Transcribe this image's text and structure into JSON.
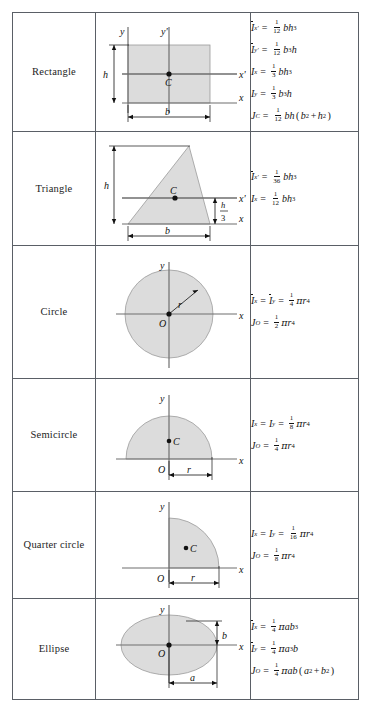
{
  "table": {
    "title": "Properties of Plane Areas",
    "columns": [
      "Shape",
      "Figure",
      "Moments of inertia"
    ],
    "rows": [
      {
        "name": "Rectangle",
        "figure": {
          "type": "rectangle",
          "axis_labels": [
            "y",
            "y'",
            "x'",
            "x"
          ],
          "centroid_label": "C",
          "dim_labels": [
            "h",
            "b"
          ]
        },
        "formulas": [
          {
            "lhs": "I",
            "lhs_bar": true,
            "lhs_sub": "x'",
            "frac_num": "1",
            "frac_den": "12",
            "rhs": "bh",
            "rhs_exp": "3"
          },
          {
            "lhs": "I",
            "lhs_bar": true,
            "lhs_sub": "y'",
            "frac_num": "1",
            "frac_den": "12",
            "rhs": "b3h",
            "rhs_exp": ""
          },
          {
            "lhs": "I",
            "lhs_bar": false,
            "lhs_sub": "x",
            "frac_num": "1",
            "frac_den": "3",
            "rhs": "bh",
            "rhs_exp": "3"
          },
          {
            "lhs": "I",
            "lhs_bar": false,
            "lhs_sub": "y",
            "frac_num": "1",
            "frac_den": "3",
            "rhs": "b3h",
            "rhs_exp": ""
          },
          {
            "lhs": "J",
            "lhs_bar": false,
            "lhs_sub": "C",
            "frac_num": "1",
            "frac_den": "12",
            "rhs": "bh(b2 + h2)",
            "rhs_exp": ""
          }
        ]
      },
      {
        "name": "Triangle",
        "figure": {
          "type": "triangle",
          "axis_labels": [
            "x'",
            "x"
          ],
          "centroid_label": "C",
          "dim_labels": [
            "h",
            "b",
            "h/3"
          ]
        },
        "formulas": [
          {
            "lhs": "I",
            "lhs_bar": true,
            "lhs_sub": "x'",
            "frac_num": "1",
            "frac_den": "36",
            "rhs": "bh",
            "rhs_exp": "3"
          },
          {
            "lhs": "I",
            "lhs_bar": false,
            "lhs_sub": "x",
            "frac_num": "1",
            "frac_den": "12",
            "rhs": "bh",
            "rhs_exp": "3"
          }
        ]
      },
      {
        "name": "Circle",
        "figure": {
          "type": "circle",
          "axis_labels": [
            "y",
            "x"
          ],
          "centroid_label": "O",
          "dim_labels": [
            "r"
          ]
        },
        "formulas": [
          {
            "lhs": "I",
            "lhs_bar": true,
            "lhs_sub": "x",
            "second_lhs": "I",
            "second_bar": true,
            "second_sub": "y",
            "frac_num": "1",
            "frac_den": "4",
            "rhs": "pir4",
            "rhs_exp": ""
          },
          {
            "lhs": "J",
            "lhs_bar": false,
            "lhs_sub": "O",
            "frac_num": "1",
            "frac_den": "2",
            "rhs": "pir4",
            "rhs_exp": ""
          }
        ]
      },
      {
        "name": "Semicircle",
        "figure": {
          "type": "semicircle",
          "axis_labels": [
            "y",
            "x"
          ],
          "centroid_label": "C",
          "origin_label": "O",
          "dim_labels": [
            "r"
          ]
        },
        "formulas": [
          {
            "lhs": "I",
            "lhs_bar": false,
            "lhs_sub": "x",
            "second_lhs": "I",
            "second_bar": false,
            "second_sub": "y",
            "frac_num": "1",
            "frac_den": "8",
            "rhs": "pir4",
            "rhs_exp": ""
          },
          {
            "lhs": "J",
            "lhs_bar": false,
            "lhs_sub": "O",
            "frac_num": "1",
            "frac_den": "4",
            "rhs": "pir4",
            "rhs_exp": ""
          }
        ]
      },
      {
        "name": "Quarter circle",
        "figure": {
          "type": "quarter-circle",
          "axis_labels": [
            "y",
            "x"
          ],
          "centroid_label": "C",
          "origin_label": "O",
          "dim_labels": [
            "r"
          ]
        },
        "formulas": [
          {
            "lhs": "I",
            "lhs_bar": false,
            "lhs_sub": "x",
            "second_lhs": "I",
            "second_bar": false,
            "second_sub": "y",
            "frac_num": "1",
            "frac_den": "16",
            "rhs": "pir4",
            "rhs_exp": ""
          },
          {
            "lhs": "J",
            "lhs_bar": false,
            "lhs_sub": "O",
            "frac_num": "1",
            "frac_den": "8",
            "rhs": "pir4",
            "rhs_exp": ""
          }
        ]
      },
      {
        "name": "Ellipse",
        "figure": {
          "type": "ellipse",
          "axis_labels": [
            "y",
            "x"
          ],
          "origin_label": "O",
          "dim_labels": [
            "b",
            "a"
          ]
        },
        "formulas": [
          {
            "lhs": "I",
            "lhs_bar": true,
            "lhs_sub": "x",
            "frac_num": "1",
            "frac_den": "4",
            "rhs": "piab3",
            "rhs_exp": ""
          },
          {
            "lhs": "I",
            "lhs_bar": true,
            "lhs_sub": "y",
            "frac_num": "1",
            "frac_den": "4",
            "rhs": "pia3b",
            "rhs_exp": ""
          },
          {
            "lhs": "J",
            "lhs_bar": false,
            "lhs_sub": "O",
            "frac_num": "1",
            "frac_den": "4",
            "rhs": "piab(a2 + b2)",
            "rhs_exp": ""
          }
        ]
      }
    ]
  },
  "labels": {
    "y": "y",
    "yprime": "y'",
    "x": "x",
    "xprime": "x'",
    "C": "C",
    "O": "O",
    "r": "r",
    "b": "b",
    "h": "h",
    "a": "a",
    "h_over_3_num": "h",
    "h_over_3_den": "3"
  },
  "colors": {
    "shape_fill": "#dcdcdc",
    "shape_stroke": "#8b8b8b",
    "axis": "#6e6e6e",
    "border": "#5a5f66",
    "text": "#131313"
  }
}
